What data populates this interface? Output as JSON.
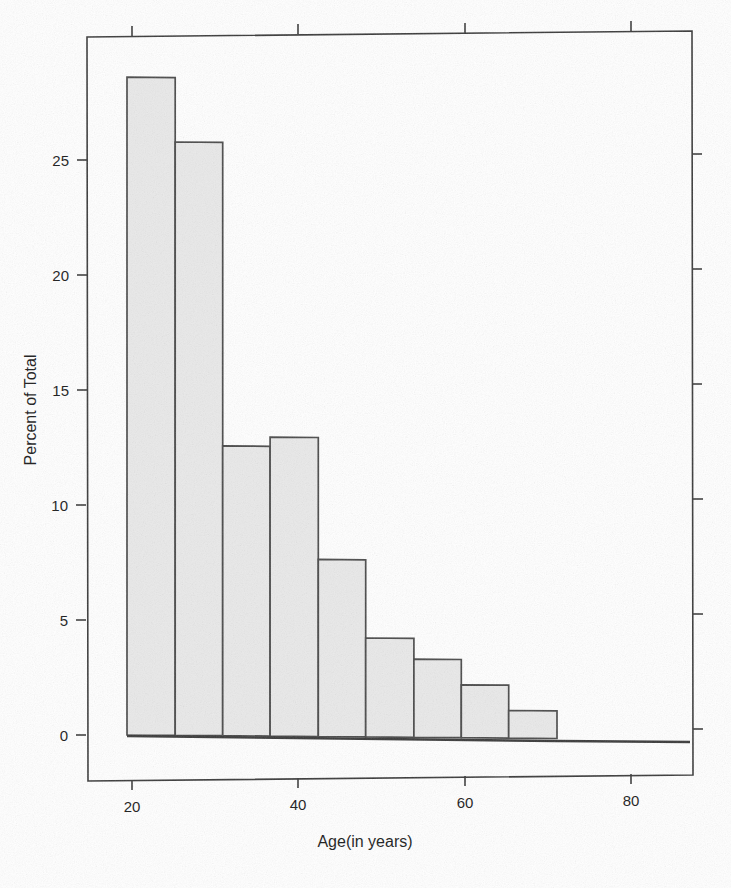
{
  "chart_data": {
    "type": "bar",
    "title": "",
    "subtitle": "",
    "xlabel": "Age(in years)",
    "ylabel": "Percent of Total",
    "xlim": [
      14.5,
      87.5
    ],
    "ylim": [
      -1.8,
      30.0
    ],
    "grid": false,
    "legend": null,
    "bin_width": 5.75,
    "x_tick_labels": [
      "20",
      "40",
      "60",
      "80"
    ],
    "x_tick_values": [
      20,
      40,
      60,
      80
    ],
    "y_tick_labels": [
      "0",
      "5",
      "10",
      "15",
      "20",
      "25"
    ],
    "y_tick_values": [
      0,
      5,
      10,
      15,
      20,
      25
    ],
    "categories": [
      "19.4-25.2",
      "25.2-30.9",
      "30.9-36.6",
      "36.6-42.4",
      "42.4-48.1",
      "48.1-53.9",
      "53.9-59.6",
      "59.6-65.3",
      "65.3-71.1"
    ],
    "bin_edges": [
      19.4,
      25.2,
      30.9,
      36.6,
      42.4,
      48.1,
      53.9,
      59.6,
      65.3,
      71.1
    ],
    "values": [
      28.6,
      25.8,
      12.6,
      13.0,
      7.7,
      4.3,
      3.4,
      2.3,
      1.2
    ],
    "series": [
      {
        "name": "Percent of Total",
        "values": [
          28.6,
          25.8,
          12.6,
          13.0,
          7.7,
          4.3,
          3.4,
          2.3,
          1.2
        ]
      }
    ],
    "colors": {
      "bar_fill": "#e9e9e9",
      "bar_stroke": "#4a4a4a",
      "axis": "#3a3a3a",
      "text": "#1a1a1a",
      "background": "#ffffff"
    }
  },
  "axes": {
    "x_axis_title": "Age(in years)",
    "y_axis_title": "Percent of Total"
  },
  "ticks": {
    "x": [
      {
        "label": "20",
        "value": 20
      },
      {
        "label": "40",
        "value": 40
      },
      {
        "label": "60",
        "value": 60
      },
      {
        "label": "80",
        "value": 80
      }
    ],
    "y": [
      {
        "label": "0",
        "value": 0
      },
      {
        "label": "5",
        "value": 5
      },
      {
        "label": "10",
        "value": 10
      },
      {
        "label": "15",
        "value": 15
      },
      {
        "label": "20",
        "value": 20
      },
      {
        "label": "25",
        "value": 25
      }
    ]
  }
}
